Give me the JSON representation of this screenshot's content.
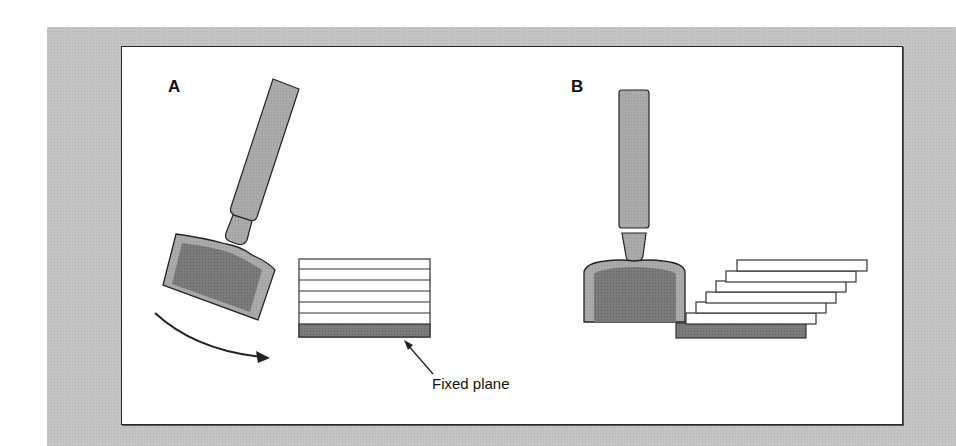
{
  "figure": {
    "panels": [
      {
        "id": "A",
        "label": "A",
        "description": "Rotating tool head tilted, layered stack with fixed base plane"
      },
      {
        "id": "B",
        "label": "B",
        "description": "Vertical tool head pressing, layers sheared and staggered"
      }
    ],
    "annotations": {
      "fixed_plane": "Fixed plane"
    },
    "stack_a": {
      "layers": 6,
      "base": "fixed plane"
    },
    "stack_b": {
      "layers": 6,
      "base": "fixed plane"
    },
    "colors": {
      "background": "#c4c4c4",
      "panel": "#ffffff",
      "tool_light": "#a9a9a9",
      "tool_dark": "#7a7a7a",
      "base_plate": "#7a7a7a",
      "outline": "#222222"
    }
  }
}
